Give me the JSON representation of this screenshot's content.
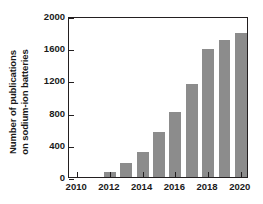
{
  "chart_data": {
    "type": "bar",
    "title": "",
    "subtitle": "",
    "xlabel": "",
    "ylabel": "Number of publications on sodium-ion batteries",
    "ylabel_lines": [
      "Number of publications",
      "on sodium-ion batteries"
    ],
    "categories": [
      2010,
      2011,
      2012,
      2013,
      2014,
      2015,
      2016,
      2017,
      2018,
      2019,
      2020
    ],
    "values": [
      0,
      0,
      60,
      170,
      315,
      565,
      810,
      1150,
      1590,
      1700,
      1790
    ],
    "series": [
      {
        "name": "Publications on sodium-ion batteries",
        "values": [
          0,
          0,
          60,
          170,
          315,
          565,
          810,
          1150,
          1590,
          1700,
          1790
        ]
      }
    ],
    "xlim": [
      2009.5,
      2020.5
    ],
    "ylim": [
      0,
      2000
    ],
    "yticks": [
      0,
      400,
      800,
      1200,
      1600,
      2000
    ],
    "ytick_labels": [
      "0",
      "400",
      "800",
      "1200",
      "1600",
      "2000"
    ],
    "xticks": [
      2010,
      2012,
      2014,
      2016,
      2018,
      2020
    ],
    "xtick_labels": [
      "2010",
      "2012",
      "2014",
      "2016",
      "2018",
      "2020"
    ],
    "grid": false,
    "legend": false,
    "legend_position": "none",
    "bar_color": "#8c8c8c",
    "axis_color": "#231f20",
    "background_color": "#ffffff",
    "annotations": []
  }
}
